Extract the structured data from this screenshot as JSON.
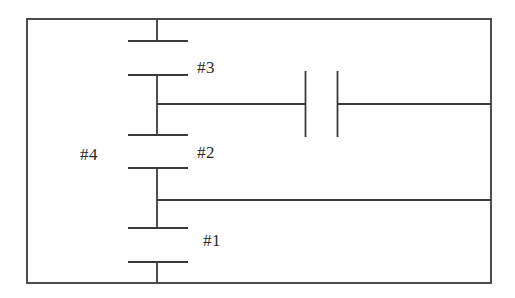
{
  "figure": {
    "kind": "circuit-schematic",
    "background_color": "#fefefe",
    "line_color": "#3a3a3a",
    "text_color": "#2b2b2b",
    "width": 515,
    "height": 298,
    "labels": {
      "n1": "#1",
      "n2": "#2",
      "n3": "#3",
      "n4": "#4"
    },
    "outer_border": {
      "left": 27,
      "top": 19,
      "right": 491,
      "bottom": 283
    },
    "rail_x": 157,
    "capacitors": [
      {
        "name": "cap-top",
        "orientation": "horizontal",
        "plate_x1": 128,
        "plate_x2": 188,
        "plate_y_top": 19,
        "plate_y_bottom": 41
      },
      {
        "name": "cap-3",
        "orientation": "horizontal",
        "plate_x1": 128,
        "plate_x2": 188,
        "plate_y_top": 75,
        "plate_y_bottom": 135
      },
      {
        "name": "cap-2",
        "orientation": "horizontal",
        "plate_x1": 128,
        "plate_x2": 188,
        "plate_y_top": 168,
        "plate_y_bottom": 228
      },
      {
        "name": "cap-1",
        "orientation": "horizontal",
        "plate_x1": 128,
        "plate_x2": 188,
        "plate_y_top": 262,
        "plate_y_bottom": 283
      },
      {
        "name": "cap-branch-up",
        "orientation": "vertical",
        "plate_y1": 71,
        "plate_y2": 137,
        "plate_x_left": 305,
        "plate_x_right": 337
      }
    ],
    "branches": [
      {
        "name": "branch-upper",
        "y": 104,
        "x_from": 157,
        "x_to": 491
      },
      {
        "name": "branch-lower",
        "y": 200,
        "x_from": 157,
        "x_to": 491
      }
    ]
  }
}
